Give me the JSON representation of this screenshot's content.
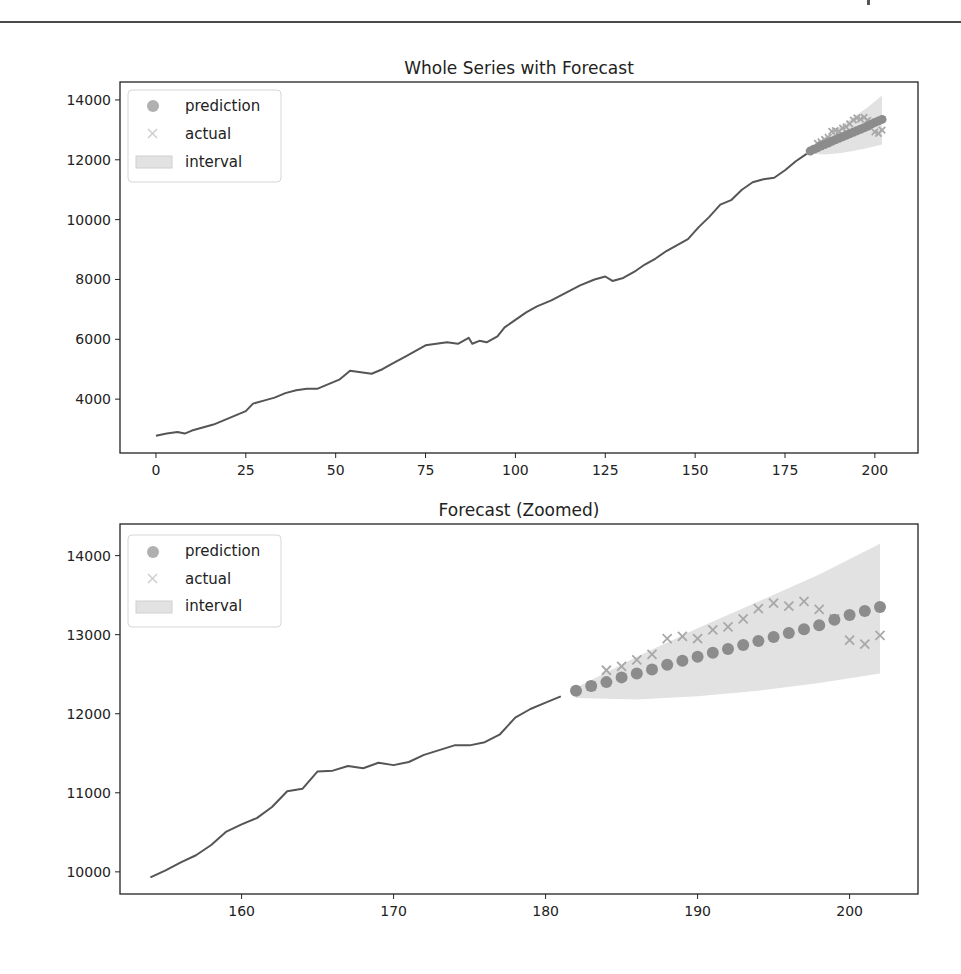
{
  "chart_data": [
    {
      "type": "line",
      "title": "Whole Series with Forecast",
      "xlabel": "",
      "ylabel": "",
      "xlim": [
        -10,
        212
      ],
      "ylim": [
        2200,
        14600
      ],
      "xticks": [
        0,
        25,
        50,
        75,
        100,
        125,
        150,
        175,
        200
      ],
      "yticks": [
        4000,
        6000,
        8000,
        10000,
        12000,
        14000
      ],
      "grid": false,
      "legend_position": "upper left",
      "legend": [
        "prediction",
        "actual",
        "interval"
      ],
      "series": [
        {
          "name": "history",
          "style": "line",
          "x": [
            0,
            3,
            6,
            8,
            10,
            13,
            16,
            19,
            22,
            25,
            27,
            30,
            33,
            36,
            39,
            42,
            45,
            48,
            51,
            54,
            57,
            60,
            63,
            66,
            69,
            72,
            75,
            78,
            81,
            84,
            87,
            88,
            90,
            92,
            95,
            97,
            100,
            103,
            106,
            110,
            114,
            118,
            122,
            125,
            127,
            130,
            133,
            136,
            139,
            142,
            145,
            148,
            151,
            154,
            157,
            160,
            163,
            166,
            169,
            172,
            175,
            178,
            181
          ],
          "values": [
            2780,
            2850,
            2900,
            2850,
            2950,
            3050,
            3150,
            3300,
            3450,
            3600,
            3850,
            3950,
            4050,
            4200,
            4300,
            4350,
            4350,
            4500,
            4650,
            4950,
            4900,
            4850,
            5000,
            5200,
            5400,
            5600,
            5800,
            5850,
            5900,
            5850,
            6050,
            5850,
            5950,
            5900,
            6100,
            6400,
            6650,
            6900,
            7100,
            7300,
            7550,
            7800,
            8000,
            8100,
            7950,
            8050,
            8250,
            8500,
            8700,
            8950,
            9150,
            9350,
            9750,
            10100,
            10500,
            10650,
            11000,
            11250,
            11350,
            11400,
            11650,
            11950,
            12200
          ]
        },
        {
          "name": "prediction",
          "style": "scatter-dot",
          "x": [
            182,
            183,
            184,
            185,
            186,
            187,
            188,
            189,
            190,
            191,
            192,
            193,
            194,
            195,
            196,
            197,
            198,
            199,
            200,
            201,
            202
          ],
          "values": [
            12290,
            12350,
            12400,
            12460,
            12510,
            12560,
            12620,
            12670,
            12720,
            12770,
            12820,
            12870,
            12920,
            12970,
            13020,
            13070,
            13120,
            13190,
            13250,
            13300,
            13350
          ]
        },
        {
          "name": "actual",
          "style": "scatter-x",
          "x": [
            183,
            184,
            185,
            186,
            187,
            188,
            189,
            190,
            191,
            192,
            193,
            194,
            195,
            196,
            197,
            198,
            199,
            200,
            201,
            202
          ],
          "values": [
            12350,
            12550,
            12600,
            12680,
            12750,
            12950,
            12980,
            12950,
            13060,
            13100,
            13200,
            13330,
            13400,
            13360,
            13420,
            13320,
            13200,
            12930,
            12880,
            12990
          ]
        },
        {
          "name": "interval",
          "style": "fill-between",
          "x": [
            182,
            186,
            190,
            194,
            198,
            202
          ],
          "lower": [
            12200,
            12180,
            12220,
            12290,
            12390,
            12510
          ],
          "upper": [
            12330,
            12720,
            13080,
            13420,
            13760,
            14150
          ]
        }
      ]
    },
    {
      "type": "line",
      "title": "Forecast (Zoomed)",
      "xlabel": "",
      "ylabel": "",
      "xlim": [
        152,
        204.5
      ],
      "ylim": [
        9720,
        14400
      ],
      "xticks": [
        160,
        170,
        180,
        190,
        200
      ],
      "yticks": [
        10000,
        11000,
        12000,
        13000,
        14000
      ],
      "grid": false,
      "legend_position": "upper left",
      "legend": [
        "prediction",
        "actual",
        "interval"
      ],
      "series": [
        {
          "name": "history",
          "style": "line",
          "x": [
            154,
            155,
            156,
            157,
            158,
            159,
            160,
            161,
            162,
            163,
            164,
            165,
            166,
            167,
            168,
            169,
            170,
            171,
            172,
            173,
            174,
            175,
            176,
            177,
            178,
            179,
            180,
            181
          ],
          "values": [
            9930,
            10020,
            10120,
            10210,
            10340,
            10510,
            10600,
            10680,
            10820,
            11020,
            11050,
            11270,
            11280,
            11340,
            11310,
            11380,
            11350,
            11390,
            11480,
            11540,
            11600,
            11600,
            11640,
            11740,
            11950,
            12060,
            12140,
            12220
          ]
        },
        {
          "name": "prediction",
          "style": "scatter-dot",
          "x": [
            182,
            183,
            184,
            185,
            186,
            187,
            188,
            189,
            190,
            191,
            192,
            193,
            194,
            195,
            196,
            197,
            198,
            199,
            200,
            201,
            202
          ],
          "values": [
            12290,
            12350,
            12400,
            12460,
            12510,
            12560,
            12620,
            12670,
            12720,
            12770,
            12820,
            12870,
            12920,
            12970,
            13020,
            13070,
            13120,
            13190,
            13250,
            13300,
            13350
          ]
        },
        {
          "name": "actual",
          "style": "scatter-x",
          "x": [
            183,
            184,
            185,
            186,
            187,
            188,
            189,
            190,
            191,
            192,
            193,
            194,
            195,
            196,
            197,
            198,
            199,
            200,
            201,
            202
          ],
          "values": [
            12350,
            12550,
            12600,
            12680,
            12750,
            12950,
            12980,
            12950,
            13060,
            13100,
            13200,
            13330,
            13400,
            13360,
            13420,
            13320,
            13200,
            12930,
            12880,
            12990
          ]
        },
        {
          "name": "interval",
          "style": "fill-between",
          "x": [
            182,
            186,
            190,
            194,
            198,
            202
          ],
          "lower": [
            12200,
            12180,
            12220,
            12290,
            12390,
            12510
          ],
          "upper": [
            12330,
            12720,
            13080,
            13420,
            13760,
            14150
          ]
        }
      ]
    }
  ],
  "colors": {
    "line": "#555555",
    "prediction": "#8c8c8c",
    "actual": "#a8a8a8",
    "interval": "#e2e2e2",
    "axes": "#222222"
  },
  "legend_labels": {
    "prediction": "prediction",
    "actual": "actual",
    "interval": "interval"
  }
}
